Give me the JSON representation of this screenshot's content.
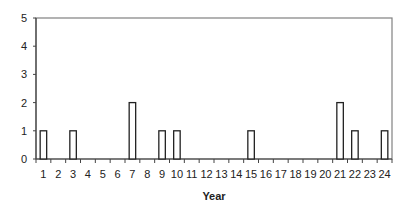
{
  "chart_data": {
    "type": "bar",
    "title": "",
    "xlabel": "Year",
    "ylabel": "",
    "ylim": [
      0,
      5
    ],
    "yticks": [
      0,
      1,
      2,
      3,
      4,
      5
    ],
    "grid": false,
    "legend": null,
    "categories": [
      "1",
      "2",
      "3",
      "4",
      "5",
      "6",
      "7",
      "8",
      "9",
      "10",
      "11",
      "12",
      "13",
      "14",
      "15",
      "16",
      "17",
      "18",
      "19",
      "20",
      "21",
      "22",
      "23",
      "24"
    ],
    "values": [
      1,
      0,
      1,
      0,
      0,
      0,
      2,
      0,
      1,
      1,
      0,
      0,
      0,
      0,
      1,
      0,
      0,
      0,
      0,
      0,
      2,
      1,
      0,
      1
    ]
  },
  "colors": {
    "bar_fill": "#ffffff",
    "bar_stroke": "#222222",
    "frame": "#808080",
    "axis": "#444444"
  }
}
